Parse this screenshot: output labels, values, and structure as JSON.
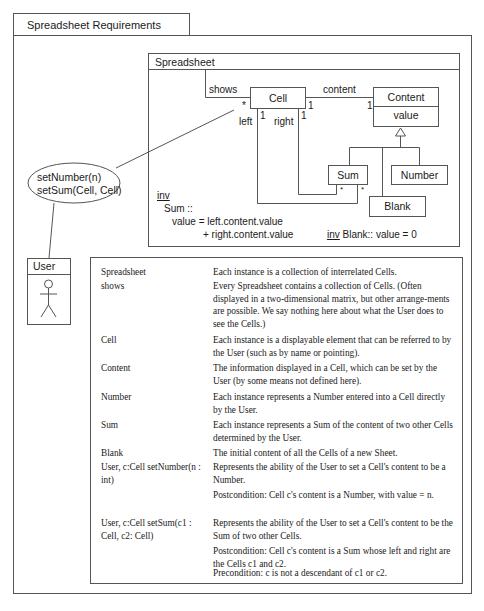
{
  "tab_title": "Spreadsheet Requirements",
  "diagram": {
    "title": "Spreadsheet",
    "classes": {
      "cell": "Cell",
      "content": "Content",
      "content_attr": "value",
      "sum": "Sum",
      "number": "Number",
      "blank": "Blank"
    },
    "associations": {
      "shows": "shows",
      "shows_mult": "*",
      "content": "content",
      "content_mult_cell": "1",
      "content_mult_content": "1",
      "left": "left",
      "left_mult": "1",
      "right": "right",
      "right_mult": "1",
      "sum_left_mult": "*",
      "sum_right_mult": "*"
    },
    "invariants": {
      "inv_keyword": "inv",
      "sum_line1": "Sum ::",
      "sum_line2": "value = left.content.value",
      "sum_line3": "+ right.content.value",
      "blank_inv_keyword": "inv",
      "blank_inv": " Blank:: value = 0"
    }
  },
  "use_case": {
    "line1": "setNumber(n)",
    "line2": "setSum(Cell, Cell)"
  },
  "actor": {
    "name": "User"
  },
  "table": {
    "rows": [
      {
        "term": "Spreadsheet",
        "desc": "Each instance is a collection of interrelated Cells."
      },
      {
        "term": "shows",
        "desc": "Every Spreadsheet contains a collection of Cells. (Often displayed in a two-dimensional matrix, but other arrange-ments are possible. We say nothing here about what the User does to see the Cells.)"
      },
      {
        "term": "Cell",
        "desc": "Each instance is a displayable element that can be referred to by the User (such as by name or pointing)."
      },
      {
        "term": "Content",
        "desc": "The information displayed in a Cell, which can be set by the User (by some means not defined here)."
      },
      {
        "term": "Number",
        "desc": "Each instance represents a Number entered into a Cell directly by the User."
      },
      {
        "term": "Sum",
        "desc": "Each instance represents a Sum of the content of two other Cells determined by the User."
      },
      {
        "term": "Blank",
        "desc": "The initial content of all the Cells of a new Sheet."
      },
      {
        "term": "User, c:Cell setNumber(n : int)",
        "desc": "Represents the ability of the User to set a Cell's content to be a Number."
      },
      {
        "term": "",
        "desc": "Postcondition: Cell c's content is a Number, with value = n."
      },
      {
        "term": "User, c:Cell setSum(c1 : Cell, c2: Cell)",
        "desc": "Represents the ability of the User to set a Cell's content to be the Sum of two other Cells."
      },
      {
        "term": "",
        "desc": "Postcondition: Cell c's content is a Sum whose left and right are the Cells c1 and c2."
      },
      {
        "term": "",
        "desc": "Precondition: c is not a descendant of c1 or c2."
      }
    ]
  }
}
